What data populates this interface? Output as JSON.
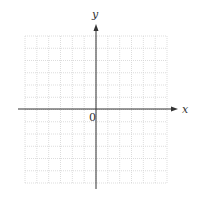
{
  "diagram": {
    "type": "cartesian-grid",
    "grid": {
      "columns": 12,
      "rows": 12,
      "left": 25,
      "top": 36,
      "right": 167,
      "bottom": 183,
      "line_color": "#d4d4d4",
      "line_style": "dotted"
    },
    "axes": {
      "color": "#333333",
      "x_axis": {
        "label": "x",
        "y": 109,
        "start": 18,
        "end": 178
      },
      "y_axis": {
        "label": "y",
        "x": 96,
        "start": 189,
        "end": 24
      },
      "origin_label": "0"
    }
  }
}
